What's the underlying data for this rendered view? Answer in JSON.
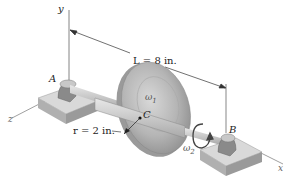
{
  "figure": {
    "type": "engineering-dynamics-diagram",
    "axes": {
      "x_label": "x",
      "y_label": "y",
      "z_label": "z"
    },
    "points": {
      "A": "A",
      "B": "B",
      "C": "C"
    },
    "dimension_L": "L = 8 in.",
    "dimension_r": "r = 2 in.",
    "omega1": "ω",
    "omega1_sub": "1",
    "omega2": "ω",
    "omega2_sub": "2",
    "colors": {
      "disk": "#b8b8b8",
      "disk_dark": "#8a8a8a",
      "shaft": "#c9c9c9",
      "base": "#d6d6d6",
      "base_side": "#a6a6a6",
      "line": "#333333"
    }
  }
}
